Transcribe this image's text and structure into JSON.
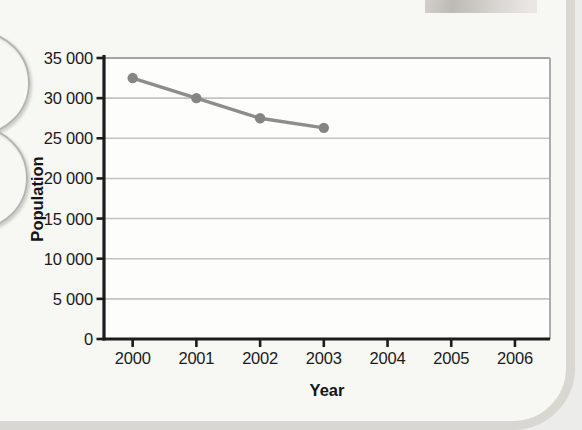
{
  "page": {
    "background_color": "#f7f7f4",
    "edge_color": "#d8d7d2",
    "outside_color": "#ececea"
  },
  "chart_data": {
    "type": "line",
    "title": "",
    "xlabel": "Year",
    "ylabel": "Population",
    "x": [
      2000,
      2001,
      2002,
      2003
    ],
    "values": [
      32500,
      30000,
      27500,
      26300
    ],
    "series_name": "Population",
    "xticks": [
      2000,
      2001,
      2002,
      2003,
      2004,
      2005,
      2006
    ],
    "xtick_labels": [
      "2000",
      "2001",
      "2002",
      "2003",
      "2004",
      "2005",
      "2006"
    ],
    "yticks": [
      0,
      5000,
      10000,
      15000,
      20000,
      25000,
      30000,
      35000
    ],
    "ytick_labels": [
      "0",
      "5 000",
      "10 000",
      "15 000",
      "20 000",
      "25 000",
      "30 000",
      "35 000"
    ],
    "xlim": [
      1999.55,
      2006.55
    ],
    "ylim": [
      0,
      35000
    ],
    "grid": "horizontal",
    "legend": "none",
    "line_color": "#8d8d8d",
    "marker": "circle",
    "marker_color": "#858585",
    "plot_bg_color": "#fdfdfc",
    "grid_color": "#c3c3c0",
    "axis_color": "#1c1c1c",
    "box_border_color": "#a4a4a1"
  }
}
